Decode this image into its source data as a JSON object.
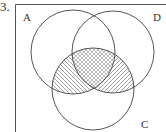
{
  "question_number": "3.",
  "diagram": {
    "type": "venn",
    "sets": [
      {
        "label": "A",
        "cx": 73,
        "cy": 52,
        "r": 42,
        "label_x": 23,
        "label_y": 21
      },
      {
        "label": "D",
        "cx": 113,
        "cy": 52,
        "r": 41,
        "label_x": 153,
        "label_y": 21
      },
      {
        "label": "C",
        "cx": 93,
        "cy": 89,
        "r": 41,
        "label_x": 141,
        "label_y": 128
      }
    ],
    "shaded_regions": [
      {
        "region": "A∩C∩D",
        "pattern": "cross-hatch"
      },
      {
        "region": "A∩C only",
        "pattern": "diagonal-backslash"
      },
      {
        "region": "C∩D only",
        "pattern": "diagonal-slash"
      }
    ],
    "colors": {
      "line": "#444444",
      "hatch": "#666666",
      "background": "#ffffff"
    }
  }
}
